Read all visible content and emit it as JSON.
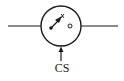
{
  "diagram": {
    "type": "controlled-switch-symbol",
    "control_label": "CS",
    "stroke_color": "#1a1a1a",
    "background_color": "#ffffff",
    "elements": [
      {
        "name": "left-terminal-wire",
        "kind": "line"
      },
      {
        "name": "switch-enclosure-circle",
        "kind": "circle"
      },
      {
        "name": "switch-pivot-contact",
        "kind": "filled-dot"
      },
      {
        "name": "switch-blade",
        "kind": "arrow-line"
      },
      {
        "name": "switch-open-contact",
        "kind": "open-dot"
      },
      {
        "name": "right-terminal-wire",
        "kind": "line"
      },
      {
        "name": "control-signal-arrow",
        "kind": "arrow",
        "direction": "up"
      }
    ]
  }
}
